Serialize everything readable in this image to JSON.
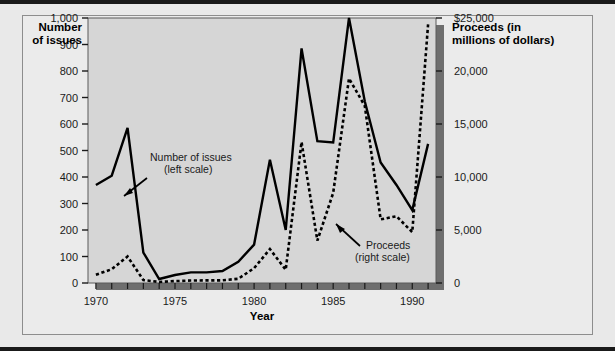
{
  "chart_data": {
    "type": "line",
    "title": "",
    "xlabel": "Year",
    "x": [
      1970,
      1971,
      1972,
      1973,
      1974,
      1975,
      1976,
      1977,
      1978,
      1979,
      1980,
      1981,
      1982,
      1983,
      1984,
      1985,
      1986,
      1987,
      1988,
      1989,
      1990,
      1991
    ],
    "xlim": [
      1969.5,
      1991.5
    ],
    "xticks": [
      1970,
      1975,
      1980,
      1985,
      1990
    ],
    "xticklabels": [
      "1970",
      "1975",
      "1980",
      "1985",
      "1990"
    ],
    "grid": false,
    "legend_position": "inline-annotations",
    "series": [
      {
        "name": "Number of issues",
        "scale": "left",
        "style": "solid",
        "color": "#000000",
        "annotation": "Number of issues\n(left scale)",
        "values": [
          370,
          405,
          585,
          115,
          15,
          30,
          40,
          40,
          45,
          80,
          145,
          465,
          200,
          885,
          535,
          530,
          1000,
          685,
          455,
          370,
          275,
          525
        ]
      },
      {
        "name": "Proceeds",
        "scale": "right",
        "style": "dotted",
        "color": "#000000",
        "annotation": "Proceeds\n(right scale)",
        "values": [
          780,
          1300,
          2500,
          280,
          100,
          180,
          230,
          250,
          250,
          400,
          1400,
          3200,
          1250,
          13300,
          4000,
          8500,
          19300,
          16700,
          6000,
          6300,
          4800,
          24400
        ]
      }
    ],
    "left_axis": {
      "title": "Number\nof issues",
      "title_line1": "Number",
      "title_line2": "of issues",
      "ylim": [
        0,
        1000
      ],
      "ticks": [
        0,
        100,
        200,
        300,
        400,
        500,
        600,
        700,
        800,
        900,
        1000
      ],
      "ticklabels": [
        "0",
        "100",
        "200",
        "300",
        "400",
        "500",
        "600",
        "700",
        "800",
        "900",
        "1,000"
      ]
    },
    "right_axis": {
      "title_line1": "Proceeds (in",
      "title_line2": "millions of dollars)",
      "ylim": [
        0,
        25000
      ],
      "ticks": [
        0,
        5000,
        10000,
        15000,
        20000,
        25000
      ],
      "ticklabels": [
        "0",
        "5,000",
        "10,000",
        "15,000",
        "20,000",
        "$25,000"
      ]
    },
    "annotations": [
      {
        "id": "issues",
        "text_line1": "Number of issues",
        "text_line2": "(left scale)"
      },
      {
        "id": "proceeds",
        "text_line1": "Proceeds",
        "text_line2": "(right scale)"
      }
    ]
  },
  "colors": {
    "page_background": "#e9e9e9",
    "plot_background": "#d6d6d6",
    "rule": "#1a1a1a",
    "line": "#000000",
    "shadow": "#6e6e6e"
  }
}
